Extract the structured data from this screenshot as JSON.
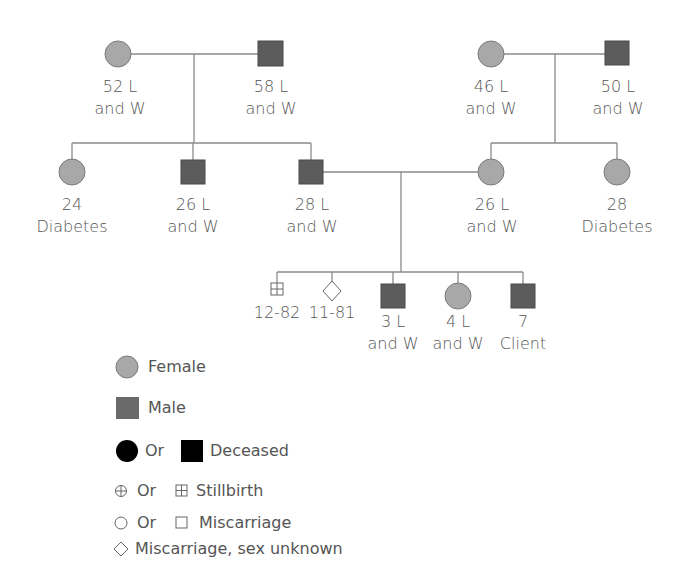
{
  "colors": {
    "female": "#a8a8a8",
    "male": "#5c5c5c",
    "deceased": "#000000",
    "line": "#8a8a8a",
    "outline": "#7a7a7a"
  },
  "generation1": {
    "paternal_grandmother": {
      "sex": "female",
      "line1": "52 L",
      "line2": "and W"
    },
    "paternal_grandfather": {
      "sex": "male",
      "line1": "58 L",
      "line2": "and W"
    },
    "maternal_grandmother": {
      "sex": "female",
      "line1": "46 L",
      "line2": "and W"
    },
    "maternal_grandfather": {
      "sex": "male",
      "line1": "50 L",
      "line2": "and W"
    }
  },
  "generation2": {
    "paternal_aunt": {
      "sex": "female",
      "line1": "24",
      "line2": "Diabetes"
    },
    "paternal_uncle": {
      "sex": "male",
      "line1": "26 L",
      "line2": "and W"
    },
    "father": {
      "sex": "male",
      "line1": "28 L",
      "line2": "and W"
    },
    "mother": {
      "sex": "female",
      "line1": "26 L",
      "line2": "and W"
    },
    "maternal_aunt": {
      "sex": "female",
      "line1": "28",
      "line2": "Diabetes"
    }
  },
  "generation3": {
    "stillbirth": {
      "type": "stillbirth-male",
      "line1": "12-82"
    },
    "miscarriage": {
      "type": "miscarriage-unknown",
      "line1": "11-81"
    },
    "brother": {
      "sex": "male",
      "line1": "3 L",
      "line2": "and W"
    },
    "sister": {
      "sex": "female",
      "line1": "4 L",
      "line2": "and W"
    },
    "client": {
      "sex": "male",
      "line1": "7",
      "line2": "Client"
    }
  },
  "legend": {
    "female": "Female",
    "male": "Male",
    "or1": "Or",
    "deceased": "Deceased",
    "or2": "Or",
    "stillbirth": "Stillbirth",
    "or3": "Or",
    "miscarriage": "Miscarriage",
    "miscarriage_unknown": "Miscarriage, sex unknown"
  }
}
